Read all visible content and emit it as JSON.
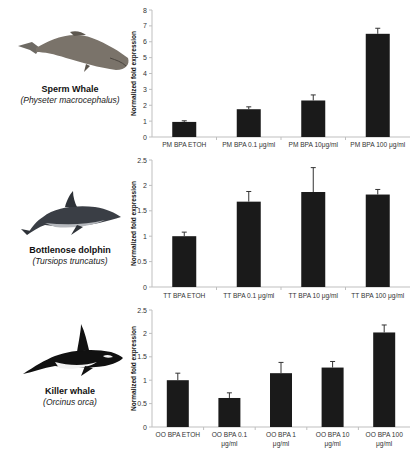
{
  "animals": [
    {
      "common": "Sperm Whale",
      "scientific": "(Physeter macrocephalus)",
      "icon": "sperm-whale-illustration"
    },
    {
      "common": "Bottlenose dolphin",
      "scientific": "(Tursiops truncatus)",
      "icon": "dolphin-illustration"
    },
    {
      "common": "Killer whale",
      "scientific": "(Orcinus orca)",
      "icon": "orca-illustration"
    }
  ],
  "colors": {
    "bar": "#1a1a1a",
    "axis": "#bfbfbf",
    "error": "#333333"
  },
  "chart_data": [
    {
      "type": "bar",
      "title": "",
      "ylabel": "Normalized fold expression",
      "xlabel": "",
      "ylim": [
        0,
        8
      ],
      "yticks": [
        0,
        1,
        2,
        3,
        4,
        5,
        6,
        7,
        8
      ],
      "categories": [
        [
          "PM BPA ETOH"
        ],
        [
          "PM BPA 0.1 μg/ml"
        ],
        [
          "PM BPA 10μg/ml"
        ],
        [
          "PM BPA 100 μg/ml"
        ]
      ],
      "values": [
        0.95,
        1.75,
        2.3,
        6.5
      ],
      "error": [
        0.07,
        0.15,
        0.35,
        0.35
      ],
      "grid": false,
      "legend": null
    },
    {
      "type": "bar",
      "title": "",
      "ylabel": "Normalized fold expression",
      "xlabel": "",
      "ylim": [
        0,
        2.5
      ],
      "yticks": [
        0,
        0.5,
        1,
        1.5,
        2,
        2.5
      ],
      "categories": [
        [
          "TT BPA ETOH"
        ],
        [
          "TT BPA 0.1 μg/ml"
        ],
        [
          "TT BPA 10 μg/ml"
        ],
        [
          "TT BPA 100 μg/ml"
        ]
      ],
      "values": [
        1.0,
        1.68,
        1.87,
        1.82
      ],
      "error": [
        0.08,
        0.2,
        0.48,
        0.1
      ],
      "grid": false,
      "legend": null
    },
    {
      "type": "bar",
      "title": "",
      "ylabel": "Normalized fold expression",
      "xlabel": "",
      "ylim": [
        0,
        2.5
      ],
      "yticks": [
        0,
        0.5,
        1,
        1.5,
        2,
        2.5
      ],
      "categories": [
        [
          "OO BPA ETOH"
        ],
        [
          "OO BPA 0.1",
          "μg/ml"
        ],
        [
          "OO BPA 1",
          "μg/ml"
        ],
        [
          "OO BPA 10",
          "μg/ml"
        ],
        [
          "OO BPA 100",
          "μg/ml"
        ]
      ],
      "values": [
        1.0,
        0.62,
        1.15,
        1.27,
        2.02
      ],
      "error": [
        0.15,
        0.11,
        0.23,
        0.13,
        0.16
      ],
      "grid": false,
      "legend": null
    }
  ]
}
